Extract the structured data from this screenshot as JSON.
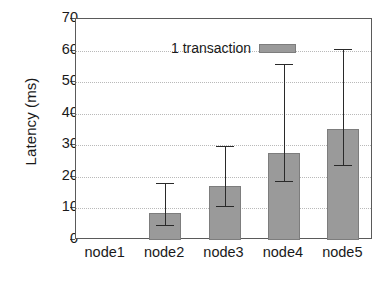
{
  "chart_data": {
    "type": "bar",
    "title": "",
    "xlabel": "",
    "ylabel": "Latency (ms)",
    "categories": [
      "node1",
      "node2",
      "node3",
      "node4",
      "node5"
    ],
    "values": [
      0,
      8.6,
      17.0,
      27.5,
      35.2
    ],
    "error_low": [
      0,
      4.8,
      10.8,
      18.6,
      23.7
    ],
    "error_high": [
      0,
      18.0,
      29.8,
      55.7,
      60.6
    ],
    "series": [
      {
        "name": "1 transaction",
        "values": [
          0,
          8.6,
          17.0,
          27.5,
          35.2
        ],
        "color": "#9a9a9a"
      }
    ],
    "ylim": [
      0,
      70
    ],
    "ytick_values": [
      0,
      10,
      20,
      30,
      40,
      50,
      60,
      70
    ],
    "ytick_labels": [
      "0",
      "10",
      "20",
      "30",
      "40",
      "50",
      "60",
      "70"
    ],
    "grid": "horizontal-dotted",
    "legend_position": "top-left-inside",
    "error_bar_style": "capped"
  },
  "legend": {
    "entries": [
      {
        "label": "1 transaction",
        "swatch_color": "#9a9a9a"
      }
    ]
  },
  "axes": {
    "y_title": "Latency (ms)",
    "x_title": ""
  },
  "colors": {
    "bar_fill": "#9a9a9a",
    "bar_stroke": "#7d7d7d",
    "axis": "#5a5a5a",
    "grid": "#b9b9b9",
    "error_bar": "#2a2a2a",
    "text": "#1a1a1a",
    "background": "#ffffff"
  }
}
